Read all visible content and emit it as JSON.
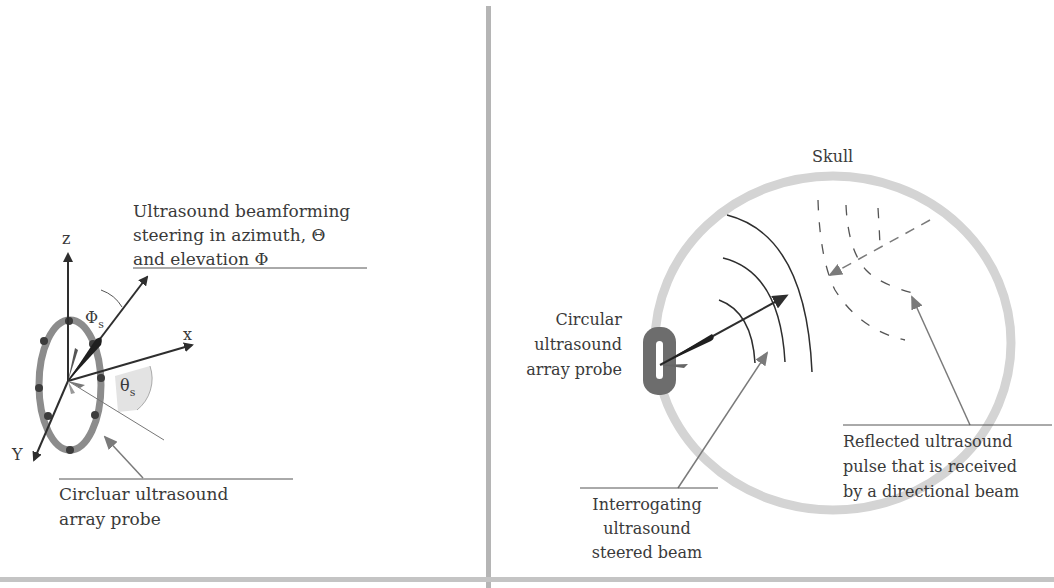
{
  "left_panel": {
    "title_lines": [
      "Ultrasound beamforming",
      "steering in azimuth,  Θ",
      "and elevation Φ"
    ],
    "axis_z": "z",
    "axis_x": "x",
    "axis_y": "Y",
    "angle_phi": "Φ",
    "angle_phi_sub": "s",
    "angle_theta": "θ",
    "angle_theta_sub": "s",
    "probe_label_lines": [
      "Circluar ultrasound",
      "array probe"
    ]
  },
  "right_panel": {
    "skull_label": "Skull",
    "probe_label_lines": [
      "Circular",
      "ultrasound",
      "array probe"
    ],
    "interrogating_label_lines": [
      "Interrogating",
      "ultrasound",
      "steered beam"
    ],
    "reflected_label_lines": [
      "Reflected ultrasound",
      "pulse that is received",
      "by a directional beam"
    ]
  },
  "colors": {
    "frame": "#b5b5b5",
    "ring": "#8a8a8a",
    "skull": "#d4d4d4",
    "ink": "#2e2e2e",
    "pointer": "#7a7a7a",
    "theta_fill": "#dedede"
  }
}
